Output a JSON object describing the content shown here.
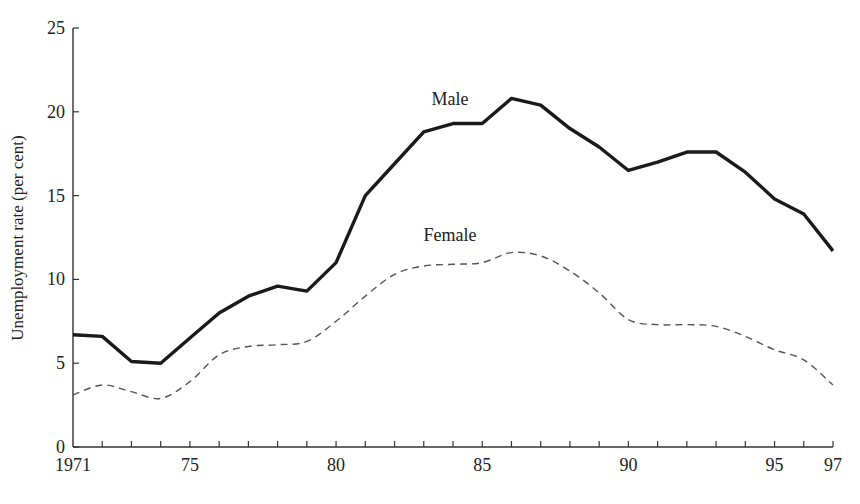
{
  "chart_data": {
    "type": "line",
    "title": "",
    "xlabel": "",
    "ylabel": "Unemployment rate (per cent)",
    "xlim": [
      1971,
      1997
    ],
    "ylim": [
      0,
      25
    ],
    "grid": false,
    "legend_position": "inline labels",
    "x": [
      1971,
      1972,
      1973,
      1974,
      1975,
      1976,
      1977,
      1978,
      1979,
      1980,
      1981,
      1982,
      1983,
      1984,
      1985,
      1986,
      1987,
      1988,
      1989,
      1990,
      1991,
      1992,
      1993,
      1994,
      1995,
      1996,
      1997
    ],
    "x_tick_labels": [
      {
        "value": 1971,
        "label": "1971"
      },
      {
        "value": 1975,
        "label": "75"
      },
      {
        "value": 1980,
        "label": "80"
      },
      {
        "value": 1985,
        "label": "85"
      },
      {
        "value": 1990,
        "label": "90"
      },
      {
        "value": 1995,
        "label": "95"
      },
      {
        "value": 1997,
        "label": "97"
      }
    ],
    "y_ticks": [
      0,
      5,
      10,
      15,
      20,
      25
    ],
    "series": [
      {
        "name": "Male",
        "style": "solid-thick",
        "color": "#1a1a1a",
        "values": [
          6.7,
          6.6,
          5.1,
          5.0,
          6.5,
          8.0,
          9.0,
          9.6,
          9.3,
          11.0,
          15.0,
          16.9,
          18.8,
          19.3,
          19.3,
          20.8,
          20.4,
          19.0,
          17.9,
          16.5,
          17.0,
          17.6,
          17.6,
          16.4,
          14.8,
          13.9,
          11.7
        ],
        "label_pos": {
          "x": 1983.9,
          "y": 20.4
        }
      },
      {
        "name": "Female",
        "style": "dashed",
        "color": "#555555",
        "values": [
          3.1,
          3.7,
          3.3,
          2.9,
          3.9,
          5.5,
          6.0,
          6.1,
          6.3,
          7.5,
          9.0,
          10.3,
          10.8,
          10.9,
          11.0,
          11.6,
          11.4,
          10.5,
          9.2,
          7.6,
          7.3,
          7.3,
          7.2,
          6.6,
          5.8,
          5.2,
          3.7
        ],
        "label_pos": {
          "x": 1983.9,
          "y": 12.3
        }
      }
    ]
  }
}
